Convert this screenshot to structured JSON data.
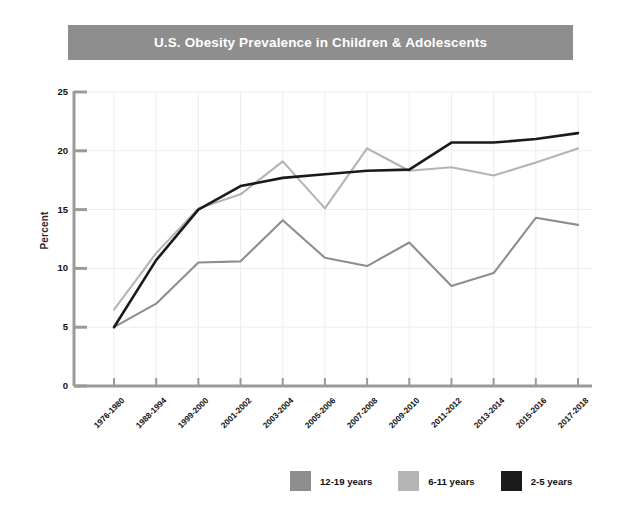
{
  "header": {
    "title": "U.S. Obesity Prevalence in Children & Adolescents",
    "bar_color": "#8e8e8e",
    "title_color": "#ffffff"
  },
  "axes": {
    "y_title": "Percent",
    "y_ticks": [
      "0",
      "5",
      "10",
      "15",
      "20",
      "25"
    ],
    "x_ticks": [
      "1976-1980",
      "1988-1994",
      "1999-2000",
      "2001-2002",
      "2003-2004",
      "2005-2006",
      "2007-2008",
      "2009-2010",
      "2011-2012",
      "2013-2014",
      "2015-2016",
      "2017-2018"
    ]
  },
  "legend": {
    "position": "bottom-right",
    "items": [
      {
        "label": "12-19 years",
        "color": "#8e8e8e"
      },
      {
        "label": "6-11 years",
        "color": "#b4b4b4"
      },
      {
        "label": "2-5 years",
        "color": "#1a1a1a"
      }
    ]
  },
  "chart_data": {
    "type": "line",
    "title": "U.S. Obesity Prevalence in Children & Adolescents",
    "xlabel": "",
    "ylabel": "Percent",
    "ylim": [
      0,
      25
    ],
    "grid": true,
    "legend_position": "bottom-right",
    "categories": [
      "1976-1980",
      "1988-1994",
      "1999-2000",
      "2001-2002",
      "2003-2004",
      "2005-2006",
      "2007-2008",
      "2009-2010",
      "2011-2012",
      "2013-2014",
      "2015-2016",
      "2017-2018"
    ],
    "series": [
      {
        "name": "12-19 years",
        "color": "#8e8e8e",
        "values": [
          5.0,
          7.0,
          10.5,
          10.6,
          14.1,
          10.9,
          10.2,
          12.2,
          8.5,
          9.6,
          14.3,
          13.7
        ]
      },
      {
        "name": "6-11 years",
        "color": "#b4b4b4",
        "values": [
          6.5,
          11.3,
          15.1,
          16.3,
          19.1,
          15.1,
          20.2,
          18.3,
          18.6,
          17.9,
          19.0,
          20.2
        ]
      },
      {
        "name": "2-5 years",
        "color": "#1a1a1a",
        "values": [
          5.0,
          10.7,
          15.0,
          17.0,
          17.7,
          18.0,
          18.3,
          18.4,
          20.7,
          20.7,
          21.0,
          21.5
        ]
      }
    ]
  }
}
